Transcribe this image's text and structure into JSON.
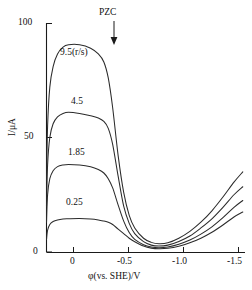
{
  "chart_data": {
    "type": "line",
    "title": "",
    "xlabel": "φ(vs. SHE)/V",
    "ylabel": "I/μA",
    "xlim": [
      0.2,
      -1.6
    ],
    "ylim": [
      0,
      100
    ],
    "xticks": [
      0,
      -0.5,
      -1.0,
      -1.5
    ],
    "xticklabels": [
      "0",
      "-0.5",
      "-1.0",
      "-1.5"
    ],
    "yticks": [
      0,
      50,
      100
    ],
    "yticklabels": [
      "0",
      "50",
      "100"
    ],
    "grid": false,
    "legend_position": "inline-annotations",
    "annotations": [
      {
        "text": "PZC",
        "x": -0.27,
        "y": 100,
        "arrow": "down"
      }
    ],
    "series": [
      {
        "name": "9.5(r/s)",
        "label": "9.5(r/s)",
        "x": [
          0.2,
          0.19,
          0.17,
          0.14,
          0.1,
          0.05,
          0.0,
          -0.1,
          -0.2,
          -0.27,
          -0.32,
          -0.36,
          -0.4,
          -0.45,
          -0.5,
          -0.55,
          -0.6,
          -0.68,
          -0.75,
          -0.82,
          -0.9,
          -1.0,
          -1.1,
          -1.2,
          -1.3,
          -1.4,
          -1.5,
          -1.58
        ],
        "values": [
          31.0,
          55.0,
          72.0,
          81.0,
          86.5,
          89.5,
          90.5,
          90.5,
          89.0,
          86.5,
          83.0,
          76.0,
          63.0,
          42.0,
          26.0,
          16.0,
          10.5,
          6.0,
          4.2,
          3.6,
          4.0,
          6.0,
          9.0,
          13.0,
          18.0,
          24.0,
          30.5,
          35.0
        ]
      },
      {
        "name": "4.5",
        "label": "4.5",
        "x": [
          0.2,
          0.19,
          0.17,
          0.14,
          0.1,
          0.05,
          0.0,
          -0.1,
          -0.2,
          -0.27,
          -0.32,
          -0.36,
          -0.4,
          -0.45,
          -0.5,
          -0.55,
          -0.6,
          -0.68,
          -0.75,
          -0.82,
          -0.9,
          -1.0,
          -1.1,
          -1.2,
          -1.3,
          -1.4,
          -1.5,
          -1.58
        ],
        "values": [
          20.0,
          38.0,
          50.0,
          56.0,
          59.0,
          60.5,
          61.0,
          60.5,
          59.5,
          58.5,
          57.0,
          54.0,
          47.0,
          33.0,
          20.0,
          12.5,
          8.0,
          4.5,
          3.0,
          2.6,
          3.0,
          4.6,
          7.0,
          10.5,
          14.5,
          19.5,
          25.0,
          28.5
        ]
      },
      {
        "name": "1.85",
        "label": "1.85",
        "x": [
          0.2,
          0.19,
          0.17,
          0.14,
          0.1,
          0.05,
          0.0,
          -0.1,
          -0.2,
          -0.27,
          -0.32,
          -0.36,
          -0.4,
          -0.45,
          -0.5,
          -0.55,
          -0.6,
          -0.68,
          -0.75,
          -0.82,
          -0.9,
          -1.0,
          -1.1,
          -1.2,
          -1.3,
          -1.4,
          -1.5,
          -1.58
        ],
        "values": [
          13.0,
          25.0,
          32.0,
          35.5,
          37.3,
          38.0,
          38.2,
          38.0,
          37.2,
          36.0,
          34.5,
          32.0,
          28.0,
          20.5,
          13.5,
          8.5,
          5.5,
          3.2,
          2.2,
          1.9,
          2.2,
          3.4,
          5.2,
          7.8,
          11.0,
          15.0,
          19.5,
          22.5
        ]
      },
      {
        "name": "0.25",
        "label": "0.25",
        "x": [
          0.2,
          0.19,
          0.17,
          0.14,
          0.1,
          0.05,
          0.0,
          -0.1,
          -0.2,
          -0.27,
          -0.32,
          -0.36,
          -0.4,
          -0.45,
          -0.5,
          -0.55,
          -0.6,
          -0.68,
          -0.75,
          -0.82,
          -0.9,
          -1.0,
          -1.1,
          -1.2,
          -1.3,
          -1.4,
          -1.5,
          -1.58
        ],
        "values": [
          5.5,
          9.5,
          12.0,
          13.3,
          14.0,
          14.4,
          14.5,
          14.6,
          14.4,
          14.0,
          13.5,
          13.0,
          12.0,
          10.0,
          8.0,
          6.0,
          4.5,
          2.6,
          1.7,
          1.4,
          1.6,
          2.5,
          4.0,
          6.0,
          8.6,
          11.8,
          15.3,
          17.5
        ]
      }
    ],
    "series_label_positions": [
      {
        "name": "9.5(r/s)",
        "left": 60,
        "top": 48
      },
      {
        "name": "4.5",
        "left": 71,
        "top": 97
      },
      {
        "name": "1.85",
        "left": 68,
        "top": 148
      },
      {
        "name": "0.25",
        "left": 66,
        "top": 198
      }
    ]
  }
}
